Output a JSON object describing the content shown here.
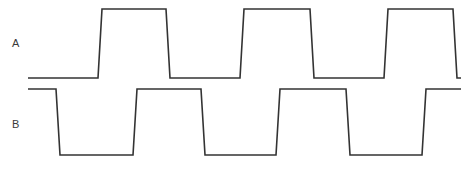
{
  "diagram": {
    "type": "digital-timing-waveform",
    "width": 463,
    "height": 170,
    "background_color": "#ffffff",
    "line_color": "#333333",
    "label_color": "#3a3a3a",
    "signals": [
      {
        "name": "A",
        "label": "A",
        "label_x": 12,
        "label_y": 47,
        "high_y": 9,
        "low_y": 78,
        "start_x": 28,
        "end_x": 461,
        "start_level": "low",
        "edge_slant": 4,
        "transitions": [
          {
            "x": 100,
            "edge": "rising"
          },
          {
            "x": 168,
            "edge": "falling"
          },
          {
            "x": 242,
            "edge": "rising"
          },
          {
            "x": 312,
            "edge": "falling"
          },
          {
            "x": 386,
            "edge": "rising"
          },
          {
            "x": 455,
            "edge": "falling"
          }
        ]
      },
      {
        "name": "B",
        "label": "B",
        "label_x": 12,
        "label_y": 128,
        "high_y": 89,
        "low_y": 155,
        "start_x": 28,
        "end_x": 461,
        "start_level": "high",
        "edge_slant": 4,
        "transitions": [
          {
            "x": 58,
            "edge": "falling"
          },
          {
            "x": 135,
            "edge": "rising"
          },
          {
            "x": 203,
            "edge": "falling"
          },
          {
            "x": 278,
            "edge": "rising"
          },
          {
            "x": 348,
            "edge": "falling"
          },
          {
            "x": 424,
            "edge": "rising"
          }
        ]
      }
    ]
  }
}
